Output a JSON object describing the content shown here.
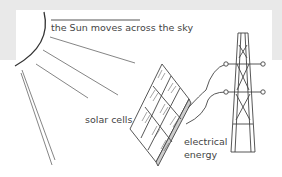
{
  "diagram": {
    "labels": {
      "sun": "the Sun moves across the sky",
      "solar_cells": "solar cells",
      "electrical_energy": "electrical energy"
    },
    "components": [
      "sun",
      "sun-rays",
      "solar-panel",
      "cables",
      "pylon"
    ],
    "colors": {
      "line": "#555555",
      "background": "#ffffff",
      "band": "#e9e9e9"
    }
  }
}
